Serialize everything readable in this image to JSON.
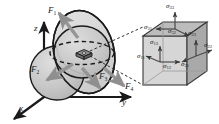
{
  "figure": {
    "type": "continuum-mechanics-stress-diagram",
    "background_color": "#ffffff",
    "line_color": "#1a1a1a",
    "arrow_gray": "#8c8c8c",
    "body_fill": "#c9c9c9",
    "disk_fill": "#d6d6d6",
    "cube_front_fill": "#d4d4d4",
    "cube_top_fill": "#bdbdbd",
    "cube_side_fill": "#a8a8a8"
  },
  "axes": {
    "x": "x",
    "y": "y",
    "z": "z"
  },
  "forces": [
    {
      "id": "F1",
      "base": "F",
      "sub": "1",
      "direction": "up-left"
    },
    {
      "id": "F2",
      "base": "F",
      "sub": "2",
      "direction": "down-left"
    },
    {
      "id": "F3",
      "base": "F",
      "sub": "3",
      "direction": "down-right"
    },
    {
      "id": "F4",
      "base": "F",
      "sub": "4",
      "direction": "down-right"
    }
  ],
  "stress_element": {
    "caption_type": "magnified-cube",
    "components": [
      {
        "id": "s33",
        "base": "σ",
        "sub": "33",
        "face": "top",
        "direction": "up"
      },
      {
        "id": "s31",
        "base": "σ",
        "sub": "31",
        "face": "top",
        "direction": "left"
      },
      {
        "id": "s32",
        "base": "σ",
        "sub": "32",
        "face": "top",
        "direction": "right"
      },
      {
        "id": "s13",
        "base": "σ",
        "sub": "13",
        "face": "front",
        "direction": "up"
      },
      {
        "id": "s11",
        "base": "σ",
        "sub": "11",
        "face": "front",
        "direction": "left-out"
      },
      {
        "id": "s12",
        "base": "σ",
        "sub": "12",
        "face": "front",
        "direction": "right"
      },
      {
        "id": "s23",
        "base": "σ",
        "sub": "23",
        "face": "right",
        "direction": "up"
      },
      {
        "id": "s21",
        "base": "σ",
        "sub": "21",
        "face": "right",
        "direction": "left"
      },
      {
        "id": "s22",
        "base": "σ",
        "sub": "22",
        "face": "right",
        "direction": "right-out"
      }
    ]
  }
}
